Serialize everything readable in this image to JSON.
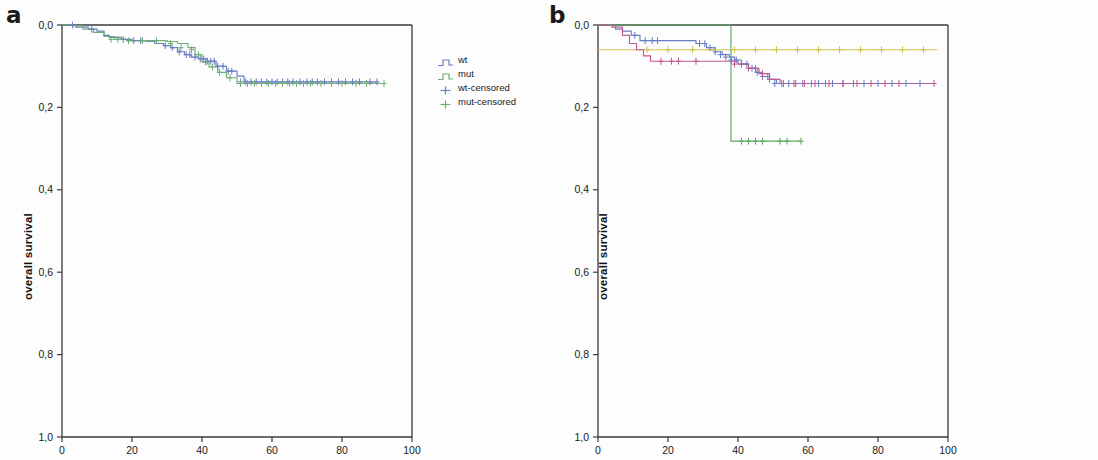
{
  "figure": {
    "width": 1098,
    "height": 460,
    "background": "#ffffff"
  },
  "colors": {
    "wt": "#6a7fc4",
    "mut": "#6fae74",
    "other_exons": "#5aa95f",
    "exon9": "#cfc14e",
    "exon20": "#c05a92",
    "axis": "#3a3a3a",
    "text": "#1a1a1a"
  },
  "panels": [
    {
      "id": "a",
      "letter": "a",
      "axis_label_y": "overall survival",
      "y_ticks": [
        "1,0",
        "0,8",
        "0,6",
        "0,4",
        "0,2",
        "0,0"
      ],
      "x_ticks": [
        "0",
        "20",
        "40",
        "60",
        "80",
        "100"
      ],
      "legend": [
        {
          "label": "wt",
          "color_key": "wt",
          "marker": "step"
        },
        {
          "label": "mut",
          "color_key": "mut",
          "marker": "step"
        },
        {
          "label": "wt-censored",
          "color_key": "wt",
          "marker": "plus"
        },
        {
          "label": "mut-censored",
          "color_key": "mut",
          "marker": "plus"
        }
      ]
    },
    {
      "id": "b",
      "letter": "b",
      "axis_label_y": "overall survival",
      "y_ticks": [
        "1,0",
        "0,8",
        "0,6",
        "0,4",
        "0,2",
        "0,0"
      ],
      "x_ticks": [
        "0",
        "20",
        "40",
        "60",
        "80",
        "100"
      ],
      "legend": [
        {
          "label": "wt",
          "color_key": "wt",
          "marker": "step"
        },
        {
          "label": "other exons",
          "color_key": "other_exons",
          "marker": "step"
        },
        {
          "label": "exon 9",
          "color_key": "exon9",
          "marker": "step"
        },
        {
          "label": "exon 20",
          "color_key": "exon20",
          "marker": "step"
        },
        {
          "label": "wt censored",
          "color_key": "wt",
          "marker": "plus"
        },
        {
          "label": "other exons censored",
          "color_key": "other_exons",
          "marker": "plus"
        },
        {
          "label": "exon 9 censored",
          "color_key": "exon9",
          "marker": "plus"
        },
        {
          "label": "exon 20 censored",
          "color_key": "exon20",
          "marker": "plus"
        }
      ]
    }
  ],
  "chart_data": [
    {
      "type": "line",
      "subplot": "a",
      "title": "",
      "xlabel": "",
      "ylabel": "overall survival",
      "xlim": [
        0,
        100
      ],
      "ylim": [
        0.0,
        1.0
      ],
      "xticks": [
        0,
        20,
        40,
        60,
        80,
        100
      ],
      "yticks": [
        0.0,
        0.2,
        0.4,
        0.6,
        0.8,
        1.0
      ],
      "grid": false,
      "legend_position": "right",
      "step_style": "post",
      "series": [
        {
          "name": "wt",
          "color": "#6a7fc4",
          "x": [
            0,
            2.5,
            4.0,
            7.5,
            10.0,
            12.0,
            13.5,
            17.0,
            20.0,
            24.0,
            26.5,
            29.0,
            31.0,
            33.0,
            35.0,
            37.0,
            39.0,
            41.5,
            44.0,
            47.0,
            50.0,
            52.0,
            90.0
          ],
          "y": [
            1.0,
            1.0,
            0.995,
            0.99,
            0.985,
            0.975,
            0.97,
            0.965,
            0.962,
            0.96,
            0.955,
            0.95,
            0.945,
            0.935,
            0.928,
            0.922,
            0.918,
            0.912,
            0.9,
            0.888,
            0.876,
            0.862,
            0.862
          ]
        },
        {
          "name": "mut",
          "color": "#6fae74",
          "x": [
            0,
            3.0,
            6.0,
            9.0,
            12.0,
            15.0,
            18.5,
            22.0,
            26.0,
            30.0,
            33.0,
            36.0,
            38.0,
            40.0,
            42.0,
            44.5,
            47.0,
            50.0,
            92.0
          ],
          "y": [
            1.0,
            0.998,
            0.99,
            0.982,
            0.972,
            0.965,
            0.962,
            0.962,
            0.962,
            0.96,
            0.955,
            0.945,
            0.928,
            0.91,
            0.898,
            0.885,
            0.872,
            0.858,
            0.858
          ]
        }
      ],
      "censor_marks": {
        "wt": {
          "x": [
            3.0,
            8.5,
            17.5,
            20.5,
            22.5,
            29.5,
            31.5,
            33.5,
            35.5,
            36.5,
            38.0,
            39.5,
            40.5,
            41.5,
            42.5,
            43.5,
            44.5,
            46.0,
            47.5,
            48.5,
            51.0,
            52.5,
            54.0,
            55.5,
            57.0,
            58.5,
            60.0,
            61.5,
            63.0,
            64.5,
            66.0,
            68.0,
            70.0,
            71.5,
            73.0,
            75.0,
            77.0,
            79.0,
            81.0,
            83.0,
            85.0,
            88.0,
            90.0
          ],
          "y": [
            1.0,
            0.99,
            0.965,
            0.962,
            0.962,
            0.95,
            0.945,
            0.935,
            0.928,
            0.928,
            0.922,
            0.918,
            0.918,
            0.912,
            0.912,
            0.912,
            0.9,
            0.9,
            0.888,
            0.888,
            0.862,
            0.862,
            0.862,
            0.862,
            0.862,
            0.862,
            0.862,
            0.862,
            0.862,
            0.862,
            0.862,
            0.862,
            0.862,
            0.862,
            0.862,
            0.862,
            0.862,
            0.862,
            0.862,
            0.862,
            0.862,
            0.862,
            0.862
          ]
        },
        "mut": {
          "x": [
            14.0,
            16.0,
            19.0,
            23.0,
            27.0,
            31.0,
            34.0,
            37.0,
            39.0,
            41.0,
            43.0,
            45.0,
            48.0,
            51.0,
            53.0,
            55.0,
            57.0,
            59.0,
            61.0,
            63.0,
            65.0,
            67.0,
            69.0,
            71.0,
            74.0,
            77.0,
            80.0,
            84.0,
            87.0,
            92.0
          ],
          "y": [
            0.965,
            0.965,
            0.962,
            0.962,
            0.962,
            0.955,
            0.945,
            0.94,
            0.928,
            0.91,
            0.898,
            0.885,
            0.872,
            0.858,
            0.858,
            0.858,
            0.858,
            0.858,
            0.858,
            0.858,
            0.858,
            0.858,
            0.858,
            0.858,
            0.858,
            0.858,
            0.858,
            0.858,
            0.858,
            0.858
          ]
        }
      }
    },
    {
      "type": "line",
      "subplot": "b",
      "title": "",
      "xlabel": "",
      "ylabel": "overall survival",
      "xlim": [
        0,
        100
      ],
      "ylim": [
        0.0,
        1.0
      ],
      "xticks": [
        0,
        20,
        40,
        60,
        80,
        100
      ],
      "yticks": [
        0.0,
        0.2,
        0.4,
        0.6,
        0.8,
        1.0
      ],
      "grid": false,
      "legend_position": "right",
      "step_style": "post",
      "series": [
        {
          "name": "wt",
          "color": "#6a7fc4",
          "x": [
            0,
            3.0,
            5.0,
            7.0,
            9.5,
            12.0,
            20.0,
            28.0,
            31.0,
            33.5,
            35.5,
            37.5,
            39.0,
            41.0,
            43.0,
            45.0,
            47.0,
            49.0,
            51.0,
            92.0
          ],
          "y": [
            1.0,
            1.0,
            0.99,
            0.985,
            0.975,
            0.962,
            0.962,
            0.955,
            0.945,
            0.935,
            0.928,
            0.922,
            0.915,
            0.905,
            0.895,
            0.885,
            0.875,
            0.868,
            0.858,
            0.858
          ]
        },
        {
          "name": "other exons",
          "color": "#5aa95f",
          "x": [
            0,
            20.0,
            38.0,
            38.0,
            40.0,
            58.0
          ],
          "y": [
            1.0,
            1.0,
            1.0,
            0.718,
            0.718,
            0.718
          ]
        },
        {
          "name": "exon 9",
          "color": "#cfc14e",
          "x": [
            0,
            10.0,
            25.0,
            40.0,
            55.0,
            70.0,
            85.0,
            97.0
          ],
          "y": [
            0.94,
            0.94,
            0.94,
            0.94,
            0.94,
            0.94,
            0.94,
            0.94
          ]
        },
        {
          "name": "exon 20",
          "color": "#c05a92",
          "x": [
            0,
            4.0,
            7.0,
            9.0,
            11.0,
            13.0,
            15.0,
            38.0,
            40.0,
            43.0,
            46.0,
            49.0,
            52.0,
            96.0
          ],
          "y": [
            1.0,
            0.995,
            0.975,
            0.955,
            0.94,
            0.925,
            0.912,
            0.912,
            0.905,
            0.895,
            0.882,
            0.868,
            0.858,
            0.858
          ]
        }
      ],
      "censor_marks": {
        "wt": {
          "x": [
            10.5,
            13.5,
            15.5,
            17.0,
            29.0,
            30.5,
            32.0,
            33.5,
            35.0,
            36.5,
            38.0,
            39.5,
            41.0,
            42.5,
            44.0,
            45.5,
            47.0,
            48.5,
            50.5,
            52.5,
            54.5,
            56.5,
            58.5,
            61.0,
            63.0,
            65.0,
            67.0,
            70.0,
            73.0,
            76.0,
            80.0,
            84.0,
            88.0,
            92.0
          ],
          "y": [
            0.975,
            0.962,
            0.962,
            0.962,
            0.955,
            0.955,
            0.945,
            0.935,
            0.928,
            0.922,
            0.915,
            0.915,
            0.905,
            0.905,
            0.895,
            0.885,
            0.875,
            0.875,
            0.858,
            0.858,
            0.858,
            0.858,
            0.858,
            0.858,
            0.858,
            0.858,
            0.858,
            0.858,
            0.858,
            0.858,
            0.858,
            0.858,
            0.858,
            0.858
          ]
        },
        "other exons": {
          "x": [
            41.0,
            43.0,
            45.0,
            47.0,
            52.0,
            54.0,
            58.0
          ],
          "y": [
            0.718,
            0.718,
            0.718,
            0.718,
            0.718,
            0.718,
            0.718
          ]
        },
        "exon 9": {
          "x": [
            14.0,
            20.0,
            27.0,
            33.0,
            39.0,
            45.0,
            51.0,
            57.0,
            63.0,
            69.0,
            75.0,
            81.0,
            87.0,
            93.0
          ],
          "y": [
            0.94,
            0.94,
            0.94,
            0.94,
            0.94,
            0.94,
            0.94,
            0.94,
            0.94,
            0.94,
            0.94,
            0.94,
            0.94,
            0.94
          ]
        },
        "exon 20": {
          "x": [
            18.0,
            21.0,
            23.0,
            28.0,
            39.0,
            41.0,
            43.0,
            45.0,
            47.0,
            49.0,
            53.0,
            56.0,
            59.0,
            62.0,
            66.0,
            70.0,
            74.0,
            78.0,
            82.0,
            86.0,
            96.0
          ],
          "y": [
            0.912,
            0.912,
            0.912,
            0.912,
            0.905,
            0.905,
            0.895,
            0.895,
            0.882,
            0.868,
            0.858,
            0.858,
            0.858,
            0.858,
            0.858,
            0.858,
            0.858,
            0.858,
            0.858,
            0.858,
            0.858
          ]
        }
      }
    }
  ]
}
